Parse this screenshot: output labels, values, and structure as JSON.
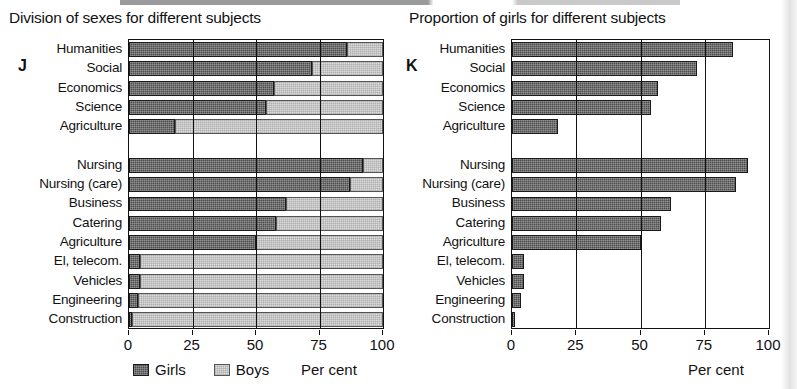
{
  "charts": {
    "left": {
      "key": "J",
      "title": "Division of sexes for different subjects",
      "unit_label": "Per cent",
      "legend": [
        {
          "name": "girls-swatch",
          "label": "Girls",
          "color": "#4d4d4d"
        },
        {
          "name": "boys-swatch",
          "label": "Boys",
          "color": "#dcdcdc"
        }
      ],
      "axis_ticks": [
        "0",
        "25",
        "50",
        "75",
        "100"
      ]
    },
    "right": {
      "key": "K",
      "title": "Proportion of girls for different subjects",
      "unit_label": "Per cent",
      "axis_ticks": [
        "0",
        "25",
        "50",
        "75",
        "100"
      ]
    }
  },
  "chart_data": [
    {
      "id": "left",
      "type": "bar",
      "orientation": "horizontal",
      "stacked": true,
      "title": "Division of sexes for different subjects",
      "xlabel": "Per cent",
      "ylabel": "",
      "xlim": [
        0,
        100
      ],
      "xticks": [
        0,
        25,
        50,
        75,
        100
      ],
      "grid": true,
      "legend": [
        "Girls",
        "Boys"
      ],
      "legend_position": "bottom-left",
      "categories": [
        "Humanities",
        "Social",
        "Economics",
        "Science",
        "Agriculture",
        "",
        "Nursing",
        "Nursing (care)",
        "Business",
        "Catering",
        "Agriculture",
        "El, telecom.",
        "Vehicles",
        "Engineering",
        "Construction"
      ],
      "series": [
        {
          "name": "Girls",
          "color": "#4d4d4d",
          "values": [
            86,
            72,
            57,
            54,
            18,
            null,
            92,
            87,
            62,
            58,
            50,
            4.5,
            4.5,
            3.5,
            1
          ]
        },
        {
          "name": "Boys",
          "color": "#dcdcdc",
          "values": [
            14,
            28,
            43,
            46,
            82,
            null,
            8,
            13,
            38,
            42,
            50,
            95.5,
            95.5,
            96.5,
            99
          ]
        }
      ]
    },
    {
      "id": "right",
      "type": "bar",
      "orientation": "horizontal",
      "stacked": false,
      "title": "Proportion of girls for different subjects",
      "xlabel": "Per cent",
      "ylabel": "",
      "xlim": [
        0,
        100
      ],
      "xticks": [
        0,
        25,
        50,
        75,
        100
      ],
      "grid": true,
      "legend": [],
      "categories": [
        "Humanities",
        "Social",
        "Economics",
        "Science",
        "Agriculture",
        "",
        "Nursing",
        "Nursing (care)",
        "Business",
        "Catering",
        "Agriculture",
        "El, telecom.",
        "Vehicles",
        "Engineering",
        "Construction"
      ],
      "series": [
        {
          "name": "Girls",
          "color": "#4d4d4d",
          "values": [
            86,
            72,
            57,
            54,
            18,
            null,
            92,
            87,
            62,
            58,
            50,
            4.5,
            4.5,
            3.5,
            1
          ]
        }
      ]
    }
  ]
}
